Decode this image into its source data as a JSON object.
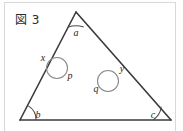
{
  "figure": {
    "caption": "図 3",
    "background_color": "#ffffff",
    "frame_color": "#d8d8d8",
    "stroke_color": "#3a3a3a",
    "thin_stroke_color": "#8a8a8a",
    "labels": {
      "apex_angle": "a",
      "bottom_left_angle": "b",
      "bottom_right_angle": "c",
      "left_circle_outer": "x",
      "left_circle_inner": "p",
      "right_circle_outer": "y",
      "right_circle_inner": "q"
    },
    "geometry": {
      "apex": [
        76,
        12
      ],
      "bottom_left": [
        20,
        120
      ],
      "bottom_right": [
        171,
        120
      ],
      "left_circle_center": [
        57,
        68
      ],
      "left_circle_radius": 10.5,
      "right_circle_center": [
        108,
        81
      ],
      "right_circle_radius": 10.5
    }
  }
}
